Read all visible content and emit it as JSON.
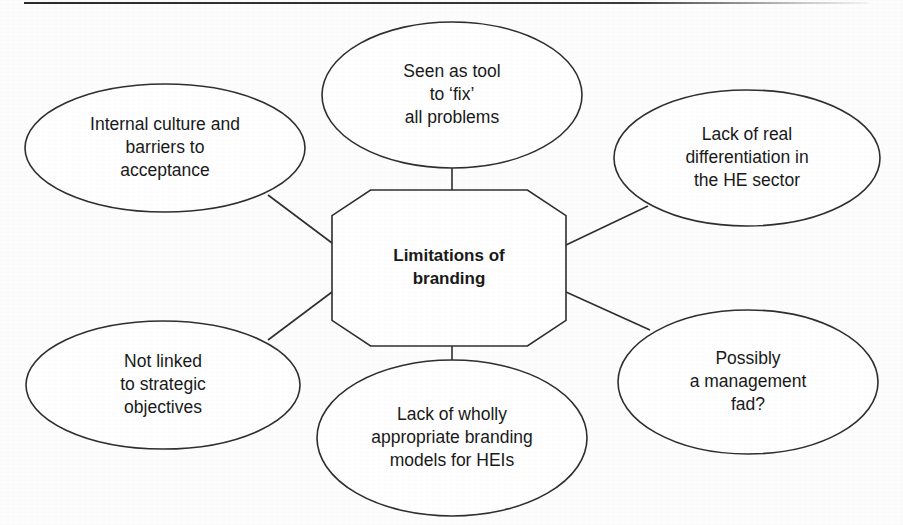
{
  "diagram": {
    "type": "hub-and-spoke concept map",
    "center": {
      "id": "center-node",
      "shape": "octagon",
      "lines": [
        "Limitations of",
        "branding"
      ],
      "bold": true,
      "cx": 449,
      "cy": 268,
      "rx": 117,
      "ry": 78,
      "corner": 0.33
    },
    "nodes": [
      {
        "id": "node-internal-culture",
        "name": "internal-culture-and-barriers-to-acceptance",
        "shape": "ellipse",
        "lines": [
          "Internal culture and",
          "barriers to",
          "acceptance"
        ],
        "cx": 165,
        "cy": 148,
        "rx": 140,
        "ry": 64
      },
      {
        "id": "node-seen-as-tool",
        "name": "seen-as-tool-to-fix-all-problems",
        "shape": "ellipse",
        "lines": [
          "Seen as tool",
          "to ‘fix’",
          "all problems"
        ],
        "cx": 452,
        "cy": 95,
        "rx": 130,
        "ry": 73
      },
      {
        "id": "node-lack-of-differentiation",
        "name": "lack-of-real-differentiation-in-the-he-sector",
        "shape": "ellipse",
        "lines": [
          "Lack of real",
          "differentiation in",
          "the HE sector"
        ],
        "cx": 747,
        "cy": 158,
        "rx": 133,
        "ry": 68
      },
      {
        "id": "node-not-linked",
        "name": "not-linked-to-strategic-objectives",
        "shape": "ellipse",
        "lines": [
          "Not linked",
          "to strategic",
          "objectives"
        ],
        "cx": 163,
        "cy": 385,
        "rx": 137,
        "ry": 64
      },
      {
        "id": "node-lack-of-models",
        "name": "lack-of-wholly-appropriate-branding-models-for-heis",
        "shape": "ellipse",
        "lines": [
          "Lack of wholly",
          "appropriate branding",
          "models for HEIs"
        ],
        "cx": 452,
        "cy": 438,
        "rx": 135,
        "ry": 78
      },
      {
        "id": "node-management-fad",
        "name": "possibly-a-management-fad",
        "shape": "ellipse",
        "lines": [
          "Possibly",
          "a management",
          "fad?"
        ],
        "cx": 748,
        "cy": 382,
        "rx": 130,
        "ry": 72
      }
    ],
    "connectors": [
      {
        "id": "connector-top",
        "from": "node-seen-as-tool",
        "to": "center-node",
        "x1": 452,
        "y1": 168,
        "x2": 452,
        "y2": 191
      },
      {
        "id": "connector-bottom",
        "from": "center-node",
        "to": "node-lack-of-models",
        "x1": 452,
        "y1": 345,
        "x2": 452,
        "y2": 381
      },
      {
        "id": "connector-top-left",
        "from": "node-internal-culture",
        "to": "center-node",
        "x1": 268,
        "y1": 195,
        "x2": 332,
        "y2": 243
      },
      {
        "id": "connector-top-right",
        "from": "node-lack-of-differentiation",
        "to": "center-node",
        "x1": 648,
        "y1": 206,
        "x2": 566,
        "y2": 245
      },
      {
        "id": "connector-bottom-left",
        "from": "node-not-linked",
        "to": "center-node",
        "x1": 268,
        "y1": 340,
        "x2": 332,
        "y2": 292
      },
      {
        "id": "connector-bottom-right",
        "from": "node-management-fad",
        "to": "center-node",
        "x1": 650,
        "y1": 330,
        "x2": 566,
        "y2": 292
      }
    ],
    "style": {
      "stroke_color": "#2f2f2f",
      "fill_color": "#ffffff",
      "text_color": "#1a1a1a",
      "background": "#fdfdfd"
    },
    "top_rule": {
      "present": true
    }
  }
}
